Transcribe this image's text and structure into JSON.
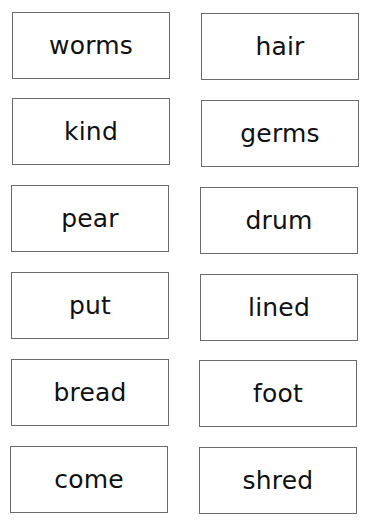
{
  "cards": [
    {
      "word": "worms"
    },
    {
      "word": "hair"
    },
    {
      "word": "kind"
    },
    {
      "word": "germs"
    },
    {
      "word": "pear"
    },
    {
      "word": "drum"
    },
    {
      "word": "put"
    },
    {
      "word": "lined"
    },
    {
      "word": "bread"
    },
    {
      "word": "foot"
    },
    {
      "word": "come"
    },
    {
      "word": "shred"
    }
  ]
}
